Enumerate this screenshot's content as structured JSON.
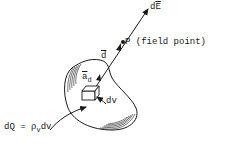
{
  "diagram": {
    "labels": {
      "dE": {
        "base": "d",
        "vec": "E"
      },
      "field_point": {
        "name": "P",
        "desc": "(field point)"
      },
      "d_vector": "d",
      "unit_vector": {
        "base": "a",
        "sub": "d"
      },
      "dv": "dv",
      "charge_eq": {
        "lhs": "dQ = ",
        "rho": "ρ",
        "rho_sub": "v",
        "rhs": "dv"
      }
    },
    "colors": {
      "ink": "#1a1a1a",
      "background": "#ffffff"
    }
  }
}
